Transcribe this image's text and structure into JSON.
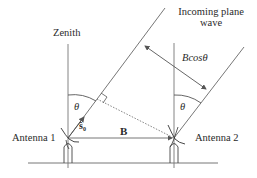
{
  "labels": {
    "zenith": "Zenith",
    "incoming_wave_line1": "Incoming plane",
    "incoming_wave_line2": "wave",
    "path_difference": "Bcosθ",
    "theta_left": "θ",
    "theta_right": "θ",
    "source_vector": "ŝ₀",
    "baseline": "B",
    "antenna_1": "Antenna 1",
    "antenna_2": "Antenna 2"
  },
  "colors": {
    "line": "#555555",
    "text": "#2a2a2a",
    "background": "#ffffff"
  }
}
